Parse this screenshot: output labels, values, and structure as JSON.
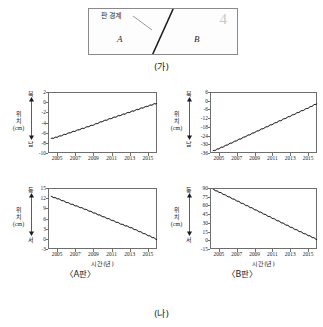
{
  "figure_a": {
    "caption": "(가)",
    "boundary_label": "판 경계",
    "region_left": "A",
    "region_right": "B",
    "page_mark": "4"
  },
  "figure_b": {
    "caption": "(나)",
    "left_caption": "〈A판〉",
    "right_caption": "〈B판〉"
  },
  "axis_text": {
    "position_label_1": "위",
    "position_label_2": "치",
    "position_unit": "(cm)",
    "north": "북",
    "south": "남",
    "east": "동",
    "west": "서",
    "xtitle": "시간(년)"
  },
  "chart_data": [
    {
      "id": "a-plate-north-south",
      "type": "line",
      "title": "〈A판〉 남북 방향 위치",
      "xlabel": "시간(년)",
      "ylabel": "위치 (cm)",
      "y_direction_top": "북",
      "y_direction_bottom": "남",
      "xlim": [
        2004,
        2016
      ],
      "ylim": [
        -10,
        2
      ],
      "xticks": [
        2005,
        2007,
        2009,
        2011,
        2013,
        2015
      ],
      "yticks": [
        2,
        0,
        -2,
        -4,
        -6,
        -8,
        -10
      ],
      "grid": false,
      "x": [
        2004.2,
        2005,
        2006,
        2007,
        2008,
        2009,
        2010,
        2011,
        2012,
        2013,
        2014,
        2015,
        2015.9
      ],
      "values": [
        -7.0,
        -6.6,
        -6.0,
        -5.4,
        -4.8,
        -4.2,
        -3.5,
        -2.9,
        -2.3,
        -1.7,
        -1.1,
        -0.5,
        0.0
      ]
    },
    {
      "id": "a-plate-east-west",
      "type": "line",
      "title": "〈A판〉 동서 방향 위치",
      "xlabel": "시간(년)",
      "ylabel": "위치 (cm)",
      "y_direction_top": "동",
      "y_direction_bottom": "서",
      "xlim": [
        2004,
        2016
      ],
      "ylim": [
        -3,
        15
      ],
      "xticks": [
        2005,
        2007,
        2009,
        2011,
        2013,
        2015
      ],
      "yticks": [
        15,
        12,
        9,
        6,
        3,
        0,
        -3
      ],
      "grid": false,
      "x": [
        2004.2,
        2005,
        2006,
        2007,
        2008,
        2009,
        2010,
        2011,
        2012,
        2013,
        2014,
        2015,
        2015.9
      ],
      "values": [
        12.8,
        12.1,
        11.0,
        10.0,
        9.0,
        7.9,
        6.8,
        5.7,
        4.6,
        3.6,
        2.4,
        1.2,
        0.1
      ]
    },
    {
      "id": "b-plate-north-south",
      "type": "line",
      "title": "〈B판〉 남북 방향 위치",
      "xlabel": "시간(년)",
      "ylabel": "위치 (cm)",
      "y_direction_top": "북",
      "y_direction_bottom": "남",
      "xlim": [
        2004,
        2016
      ],
      "ylim": [
        -36,
        6
      ],
      "xticks": [
        2005,
        2007,
        2009,
        2011,
        2013,
        2015
      ],
      "yticks": [
        6,
        0,
        -6,
        -12,
        -18,
        -24,
        -30,
        -36
      ],
      "grid": false,
      "x": [
        2004.2,
        2005,
        2006,
        2007,
        2008,
        2009,
        2010,
        2011,
        2012,
        2013,
        2014,
        2015,
        2015.9
      ],
      "values": [
        -34.0,
        -32.0,
        -29.2,
        -26.4,
        -23.6,
        -20.8,
        -18.0,
        -15.2,
        -12.4,
        -9.6,
        -6.8,
        -4.0,
        -1.2
      ]
    },
    {
      "id": "b-plate-east-west",
      "type": "line",
      "title": "〈B판〉 동서 방향 위치",
      "xlabel": "시간(년)",
      "ylabel": "위치 (cm)",
      "y_direction_top": "동",
      "y_direction_bottom": "서",
      "xlim": [
        2004,
        2016
      ],
      "ylim": [
        -15,
        90
      ],
      "xticks": [
        2005,
        2007,
        2009,
        2011,
        2013,
        2015
      ],
      "yticks": [
        90,
        75,
        60,
        45,
        30,
        15,
        0,
        -15
      ],
      "grid": false,
      "x": [
        2004.2,
        2005,
        2006,
        2007,
        2008,
        2009,
        2010,
        2011,
        2012,
        2013,
        2014,
        2015,
        2015.9
      ],
      "values": [
        89.5,
        84.0,
        76.5,
        69.0,
        61.5,
        54.0,
        46.5,
        39.0,
        31.5,
        24.0,
        16.5,
        9.5,
        3.0
      ]
    }
  ]
}
